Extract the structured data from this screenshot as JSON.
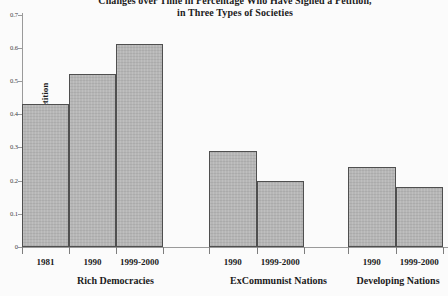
{
  "title": {
    "line1": "Changes over Time in Percentage Who Have Signed a Petition,",
    "line2": "in Three Types of Societies"
  },
  "chart_data": {
    "type": "bar",
    "title": "Changes over Time in Percentage Who Have Signed a Petition, in Three Types of Societies",
    "ylabel": "% who have signed a petition",
    "xlabel": "",
    "ylim": [
      0,
      0.7
    ],
    "yticks": [
      0.7,
      0.6,
      0.5,
      0.4,
      0.3,
      0.2,
      0.1,
      0
    ],
    "grid": false,
    "legend": "none",
    "groups": [
      {
        "label": "Rich Democracies",
        "bars": [
          {
            "category": "1981",
            "value": 0.43
          },
          {
            "category": "1990",
            "value": 0.52
          },
          {
            "category": "1999-2000",
            "value": 0.61
          }
        ]
      },
      {
        "label": "ExCommunist Nations",
        "bars": [
          {
            "category": "1990",
            "value": 0.29
          },
          {
            "category": "1999-2000",
            "value": 0.2
          }
        ]
      },
      {
        "label": "Developing Nations",
        "bars": [
          {
            "category": "1990",
            "value": 0.24
          },
          {
            "category": "1999-2000",
            "value": 0.18
          }
        ]
      }
    ],
    "colors": {
      "bar_fill": "#b6b6b6",
      "bar_border": "#4f4f4f",
      "axis": "#9a9a9a",
      "text": "#1c1c1c"
    }
  }
}
